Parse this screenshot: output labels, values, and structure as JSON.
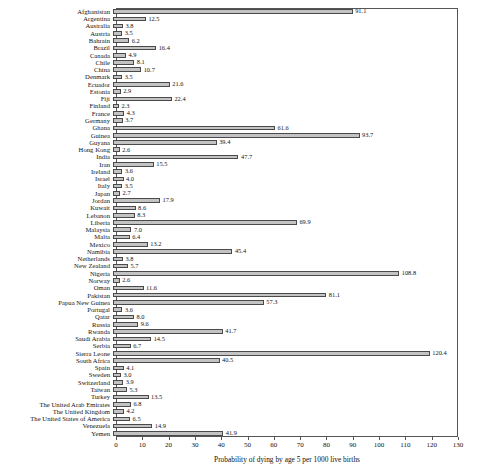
{
  "chart_data": {
    "type": "bar",
    "orientation": "horizontal",
    "title": "",
    "xlabel": "Probability of dying by age 5 per 1000 live births",
    "ylabel": "",
    "xlim": [
      0,
      130
    ],
    "xticks": [
      0,
      10,
      20,
      30,
      40,
      50,
      60,
      70,
      80,
      90,
      100,
      110,
      120,
      130
    ],
    "grid": false,
    "legend": false,
    "bar_fill_color": "#c3c3c3",
    "bar_edge_color": "#4a4a4a",
    "categories": [
      "Afghanistan",
      "Argentina",
      "Australia",
      "Austria",
      "Bahrain",
      "Brazil",
      "Canada",
      "Chile",
      "China",
      "Denmark",
      "Ecuador",
      "Estonia",
      "Fiji",
      "Finland",
      "France",
      "Germany",
      "Ghana",
      "Guinea",
      "Guyana",
      "Hong Kong",
      "India",
      "Iran",
      "Ireland",
      "Israel",
      "Italy",
      "Japan",
      "Jordan",
      "Kuwait",
      "Lebanon",
      "Liberia",
      "Malaysia",
      "Malta",
      "Mexico",
      "Namibia",
      "Netherlands",
      "New Zealand",
      "Nigeria",
      "Norway",
      "Oman",
      "Pakistan",
      "Papua New Guinea",
      "Portugal",
      "Qatar",
      "Russia",
      "Rwanda",
      "Saudi Arabia",
      "Serbia",
      "Sierra Leone",
      "South Africa",
      "Spain",
      "Sweden",
      "Switzerland",
      "Taiwan",
      "Turkey",
      "The United Arab Emirates",
      "The United Kingdom",
      "The United States of America",
      "Venezuela",
      "Yemen"
    ],
    "values": [
      91.1,
      12.5,
      3.8,
      3.5,
      6.2,
      16.4,
      4.9,
      8.1,
      10.7,
      3.5,
      21.6,
      2.9,
      22.4,
      2.3,
      4.3,
      3.7,
      61.6,
      93.7,
      39.4,
      2.6,
      47.7,
      15.5,
      3.6,
      4.0,
      3.5,
      2.7,
      17.9,
      8.6,
      8.3,
      69.9,
      7.0,
      6.4,
      13.2,
      45.4,
      3.8,
      5.7,
      108.8,
      2.6,
      11.6,
      81.1,
      57.3,
      3.6,
      8.0,
      9.6,
      41.7,
      14.5,
      6.7,
      120.4,
      40.5,
      4.1,
      3.0,
      3.9,
      5.3,
      13.5,
      6.8,
      4.2,
      6.5,
      14.9,
      41.9
    ],
    "value_labels": [
      "91.1",
      "12.5",
      "3.8",
      "3.5",
      "6.2",
      "16.4",
      "4.9",
      "8.1",
      "10.7",
      "3.5",
      "21.6",
      "2.9",
      "22.4",
      "2.3",
      "4.3",
      "3.7",
      "61.6",
      "93.7",
      "39.4",
      "2.6",
      "47.7",
      "15.5",
      "3.6",
      "4.0",
      "3.5",
      "2.7",
      "17.9",
      "8.6",
      "8.3",
      "69.9",
      "7.0",
      "6.4",
      "13.2",
      "45.4",
      "3.8",
      "5.7",
      "108.8",
      "2.6",
      "11.6",
      "81.1",
      "57.3",
      "3.6",
      "8.0",
      "9.6",
      "41.7",
      "14.5",
      "6.7",
      "120.4",
      "40.5",
      "4.1",
      "3.0",
      "3.9",
      "5.3",
      "13.5",
      "6.8",
      "4.2",
      "6.5",
      "14.9",
      "41.9"
    ]
  }
}
